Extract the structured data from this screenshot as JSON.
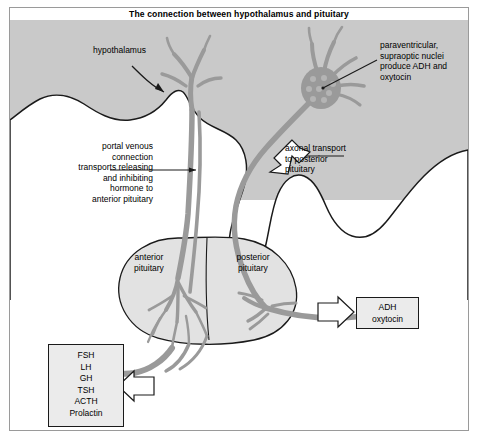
{
  "title": "The connection between hypothalamus and pituitary",
  "labels": {
    "hypothalamus": "hypothalamus",
    "paraventricular": "paraventricular,\nsupraoptic nuclei\nproduce ADH and\noxytocin",
    "portal": "portal venous\nconnection\ntransports releasing\nand inhibiting\nhormone to\nanterior pituitary",
    "axonal": "axonal transport\nto posterior\npituitary",
    "anterior_pituitary": "anterior\npituitary",
    "posterior_pituitary": "posterior\npituitary"
  },
  "boxes": {
    "adh": {
      "lines": [
        "ADH",
        "oxytocin"
      ]
    },
    "anterior_hormones": {
      "lines": [
        "FSH",
        "LH",
        "GH",
        "TSH",
        "ACTH",
        "Prolactin"
      ]
    }
  },
  "colors": {
    "background_tissue": "#c9c9c9",
    "white_tissue": "#ffffff",
    "vessel": "#9a9a9a",
    "outline": "#1a1a1a",
    "box_fill": "#ebebeb",
    "frame": "#9a9a9a"
  }
}
